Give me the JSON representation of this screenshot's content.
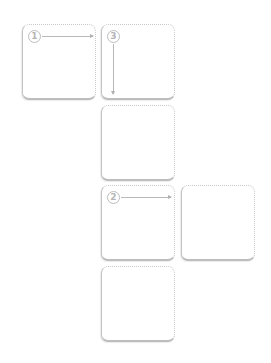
{
  "diagram": {
    "type": "tile-flow",
    "colors": {
      "border": "#c4c4c4",
      "marker": "#b5b5b5",
      "background": "#ffffff"
    },
    "tiles": [
      {
        "id": "A",
        "step": "1",
        "arrow": "right"
      },
      {
        "id": "B",
        "step": "3",
        "arrow": "down"
      },
      {
        "id": "C",
        "step": null,
        "arrow": null
      },
      {
        "id": "D",
        "step": "2",
        "arrow": "right"
      },
      {
        "id": "E",
        "step": null,
        "arrow": null
      },
      {
        "id": "F",
        "step": null,
        "arrow": null
      }
    ]
  }
}
